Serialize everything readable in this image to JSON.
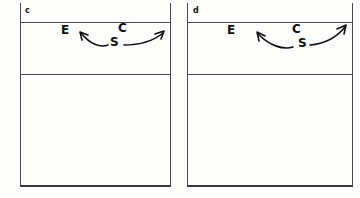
{
  "figure": {
    "background_color": "#fdfdfc",
    "line_color": "#4a4a4a",
    "ink_color": "#0f0f0f",
    "panels": [
      {
        "label": "c",
        "glyphs": [
          {
            "text": "E",
            "name": "label-e"
          },
          {
            "text": "C",
            "name": "label-c"
          },
          {
            "text": "S",
            "name": "label-s"
          }
        ],
        "arrow": {
          "name": "double-headed-curved-arrow",
          "description": "curved double-headed arrow, left head points up-left, right head points up-right"
        }
      },
      {
        "label": "d",
        "glyphs": [
          {
            "text": "E",
            "name": "label-e"
          },
          {
            "text": "C",
            "name": "label-c"
          },
          {
            "text": "S",
            "name": "label-s"
          }
        ],
        "arrow": {
          "name": "double-headed-curved-arrow",
          "description": "curved double-headed arrow, left head points up-left, right head points up-right"
        }
      }
    ]
  }
}
